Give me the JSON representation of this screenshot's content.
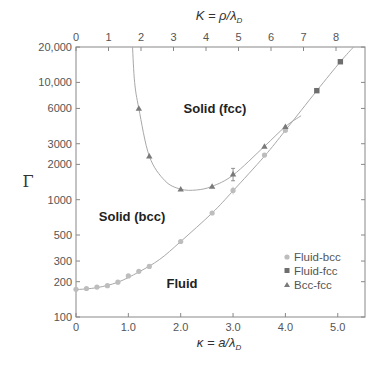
{
  "chart_data": {
    "type": "scatter",
    "title": "",
    "xlabel": "κ = a/λD",
    "x2label": "K = ρ/λD",
    "ylabel": "Γ",
    "yscale": "log",
    "xlim": [
      0,
      5.5
    ],
    "x2lim": [
      0,
      8.9
    ],
    "ylim": [
      100,
      20000
    ],
    "x_ticks": [
      "0",
      "1.0",
      "2.0",
      "3.0",
      "4.0",
      "5.0"
    ],
    "x2_ticks": [
      "0",
      "1",
      "2",
      "3",
      "4",
      "5",
      "6",
      "7",
      "8"
    ],
    "y_ticks": [
      "100",
      "200",
      "300",
      "500",
      "1000",
      "2000",
      "3000",
      "6000",
      "10,000",
      "20,000"
    ],
    "grid": false,
    "legend_position": "lower right",
    "series": [
      {
        "name": "Fluid-bcc",
        "marker": "circle",
        "color": "#bdbdbd",
        "x": [
          0,
          0.2,
          0.4,
          0.6,
          0.8,
          1.0,
          1.2,
          1.4,
          2.0,
          2.6,
          3.0,
          3.6,
          4.0
        ],
        "y": [
          172,
          175,
          180,
          185,
          198,
          224,
          245,
          270,
          440,
          770,
          1200,
          2400,
          3900
        ]
      },
      {
        "name": "Fluid-fcc",
        "marker": "square",
        "color": "#6e6e6e",
        "x": [
          4.6,
          5.05
        ],
        "y": [
          8500,
          15000
        ]
      },
      {
        "name": "Bcc-fcc",
        "marker": "triangle",
        "color": "#7a7a7a",
        "x": [
          1.2,
          1.4,
          2.0,
          2.6,
          3.0,
          3.6,
          4.0
        ],
        "y": [
          6000,
          2350,
          1230,
          1300,
          1650,
          2850,
          4200
        ]
      }
    ],
    "annotations": [
      {
        "text": "Solid (fcc)",
        "x": 2.7,
        "y": 7000
      },
      {
        "text": "Solid (bcc)",
        "x": 1.1,
        "y": 850
      },
      {
        "text": "Fluid",
        "x": 2.0,
        "y": 185
      }
    ]
  },
  "axes": {
    "top_title": "K = ρ/λ",
    "top_title_sub": "D",
    "bottom_title": "κ = a/λ",
    "bottom_title_sub": "D",
    "left_title": "Γ"
  },
  "legend": [
    {
      "label": "Fluid-bcc"
    },
    {
      "label": "Fluid-fcc"
    },
    {
      "label": "Bcc-fcc"
    }
  ],
  "regions": {
    "fcc": "Solid (fcc)",
    "bcc": "Solid (bcc)",
    "fluid": "Fluid"
  }
}
